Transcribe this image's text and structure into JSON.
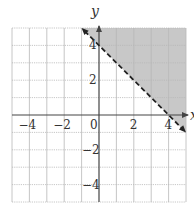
{
  "chart_data": {
    "type": "area",
    "title": "",
    "xlabel": "x",
    "ylabel": "y",
    "xlim": [
      -5,
      5
    ],
    "ylim": [
      -5,
      5
    ],
    "grid": true,
    "x_tick_labels": [
      "-4",
      "-2",
      "0",
      "2",
      "4"
    ],
    "y_tick_labels": [
      "4",
      "2",
      "-2",
      "-4"
    ],
    "boundary_line": {
      "equation": "y = -x + 4",
      "style": "dashed",
      "points": [
        [
          -1,
          5
        ],
        [
          5,
          -1
        ]
      ],
      "arrows": "both"
    },
    "shaded_region": {
      "inequality": "x + y > 4",
      "polygon": [
        [
          -1,
          5
        ],
        [
          5,
          5
        ],
        [
          5,
          -1
        ]
      ],
      "color": "#c8c8c8"
    }
  },
  "labels": {
    "x_axis": "x",
    "y_axis": "y",
    "ticks_x": [
      {
        "value": -4,
        "text": "−4"
      },
      {
        "value": -2,
        "text": "−2"
      },
      {
        "value": 0,
        "text": "0"
      },
      {
        "value": 2,
        "text": "2"
      },
      {
        "value": 4,
        "text": "4"
      }
    ],
    "ticks_y": [
      {
        "value": 4,
        "text": "4"
      },
      {
        "value": 2,
        "text": "2"
      },
      {
        "value": -2,
        "text": "−2"
      },
      {
        "value": -4,
        "text": "−4"
      }
    ]
  },
  "colors": {
    "shade": "#c8c8c8",
    "grid": "#b8b8b8",
    "axis": "#444444",
    "line": "#222222"
  }
}
